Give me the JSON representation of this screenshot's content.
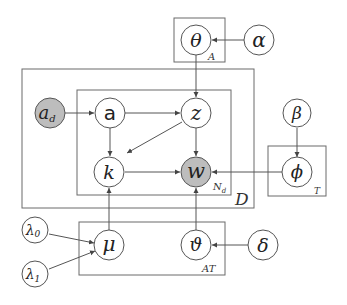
{
  "diagram": {
    "type": "plate-notation graphical model",
    "colors": {
      "observed_fill": "#bdbdbd",
      "latent_fill": "#ffffff",
      "stroke": "#555555"
    },
    "nodes": {
      "theta": {
        "label": "θ",
        "observed": false
      },
      "alpha": {
        "label": "α",
        "observed": false
      },
      "a_d": {
        "label": "a",
        "sub": "d",
        "observed": true
      },
      "a": {
        "label": "a",
        "observed": false
      },
      "z": {
        "label": "z",
        "observed": false
      },
      "k": {
        "label": "k",
        "observed": false
      },
      "w": {
        "label": "w",
        "observed": true
      },
      "beta": {
        "label": "β",
        "observed": false
      },
      "phi": {
        "label": "ϕ",
        "observed": false
      },
      "lambda0": {
        "label": "λ",
        "sub": "0",
        "observed": false
      },
      "lambda1": {
        "label": "λ",
        "sub": "1",
        "observed": false
      },
      "mu": {
        "label": "μ",
        "observed": false
      },
      "vartheta": {
        "label": "ϑ",
        "observed": false
      },
      "delta": {
        "label": "δ",
        "observed": false
      }
    },
    "plates": {
      "A": {
        "label": "A"
      },
      "D": {
        "label": "D"
      },
      "Nd": {
        "label": "N",
        "sub": "d"
      },
      "T": {
        "label": "T"
      },
      "AT": {
        "label": "AT"
      }
    },
    "edges": [
      [
        "alpha",
        "theta"
      ],
      [
        "theta",
        "z"
      ],
      [
        "a_d",
        "a"
      ],
      [
        "a",
        "z"
      ],
      [
        "a",
        "k"
      ],
      [
        "z",
        "k"
      ],
      [
        "z",
        "w"
      ],
      [
        "k",
        "w"
      ],
      [
        "beta",
        "phi"
      ],
      [
        "phi",
        "w"
      ],
      [
        "mu",
        "k"
      ],
      [
        "vartheta",
        "w"
      ],
      [
        "delta",
        "vartheta"
      ],
      [
        "lambda0",
        "mu"
      ],
      [
        "lambda1",
        "mu"
      ]
    ]
  }
}
